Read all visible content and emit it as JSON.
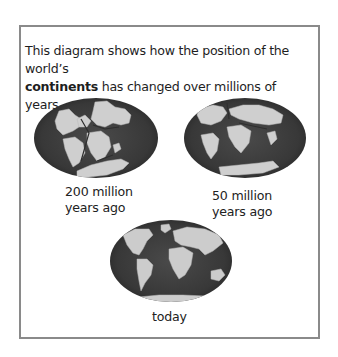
{
  "intro": {
    "line1": "This diagram shows how the position of the world’s",
    "bold_word": "continents",
    "line2_rest": " has changed over millions of years."
  },
  "globes": [
    {
      "id": "200mya",
      "label_line1": "200 million",
      "label_line2": "years ago"
    },
    {
      "id": "50mya",
      "label_line1": "50 million",
      "label_line2": "years ago"
    },
    {
      "id": "today",
      "label_line1": "today"
    }
  ],
  "colors": {
    "ocean": "#3c3c3c",
    "ocean_edge": "#2a2a2a",
    "land": "#cfcfcf",
    "border": "#8a8a8a"
  }
}
